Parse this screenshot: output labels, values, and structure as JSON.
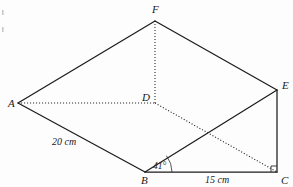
{
  "figure": {
    "type": "geometry-diagram",
    "stroke_color": "#1c1c1c",
    "background": "#fdfdfd"
  },
  "vertices": [
    {
      "id": "A",
      "label": "A",
      "x": 18,
      "y": 103,
      "label_x": 8,
      "label_y": 107
    },
    {
      "id": "B",
      "label": "B",
      "x": 145,
      "y": 172,
      "label_x": 141,
      "label_y": 184
    },
    {
      "id": "C",
      "label": "C",
      "x": 277,
      "y": 172,
      "label_x": 281,
      "label_y": 184
    },
    {
      "id": "D",
      "label": "D",
      "x": 155,
      "y": 103,
      "label_x": 142,
      "label_y": 101
    },
    {
      "id": "E",
      "label": "E",
      "x": 277,
      "y": 90,
      "label_x": 282,
      "label_y": 89
    },
    {
      "id": "F",
      "label": "F",
      "x": 155,
      "y": 21,
      "label_x": 152,
      "label_y": 13
    }
  ],
  "edges": [
    {
      "from": "A",
      "to": "F",
      "style": "solid",
      "name": "edge-af"
    },
    {
      "from": "F",
      "to": "E",
      "style": "solid",
      "name": "edge-fe"
    },
    {
      "from": "A",
      "to": "B",
      "style": "solid",
      "name": "edge-ab"
    },
    {
      "from": "B",
      "to": "C",
      "style": "solid",
      "name": "edge-bc"
    },
    {
      "from": "B",
      "to": "E",
      "style": "solid",
      "name": "edge-be"
    },
    {
      "from": "E",
      "to": "C",
      "style": "solid",
      "name": "edge-ec"
    },
    {
      "from": "A",
      "to": "D",
      "style": "dotted",
      "name": "edge-ad"
    },
    {
      "from": "D",
      "to": "F",
      "style": "dotted",
      "name": "edge-df"
    },
    {
      "from": "D",
      "to": "C",
      "style": "dotted",
      "name": "edge-dc"
    }
  ],
  "measurements": [
    {
      "id": "ab-length",
      "text": "20 cm",
      "x": 52,
      "y": 145,
      "edge": "A-B"
    },
    {
      "id": "bc-length",
      "text": "15 cm",
      "x": 205,
      "y": 183,
      "edge": "B-C"
    }
  ],
  "angles": [
    {
      "id": "angle-ebc",
      "text": "41°",
      "vertex": "B",
      "label_x": 153,
      "label_y": 169,
      "arc_radius": 27
    }
  ],
  "right_angles": [
    {
      "id": "right-angle-c",
      "vertex": "C",
      "size": 6
    }
  ],
  "specks": [
    {
      "x": 2,
      "y": 10,
      "w": 1.6,
      "h": 5
    },
    {
      "x": 2,
      "y": 27,
      "w": 1.6,
      "h": 5
    }
  ]
}
